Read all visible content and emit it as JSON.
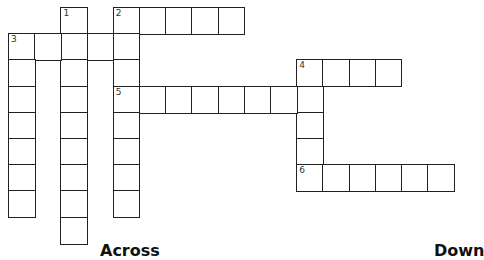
{
  "puzzle": {
    "type": "crossword",
    "grid_origin": {
      "x": 8,
      "y": 7
    },
    "cell_size": 26.2,
    "entries": [
      {
        "number": 1,
        "direction": "down",
        "row": 0,
        "col": 2,
        "length": 9
      },
      {
        "number": 2,
        "direction": "across",
        "row": 0,
        "col": 4,
        "length": 5
      },
      {
        "number": 2,
        "direction": "down",
        "row": 0,
        "col": 4,
        "length": 8
      },
      {
        "number": 3,
        "direction": "across",
        "row": 1,
        "col": 0,
        "length": 5
      },
      {
        "number": 3,
        "direction": "down",
        "row": 1,
        "col": 0,
        "length": 7
      },
      {
        "number": 4,
        "direction": "across",
        "row": 2,
        "col": 11,
        "length": 4
      },
      {
        "number": 4,
        "direction": "down",
        "row": 2,
        "col": 11,
        "length": 5
      },
      {
        "number": 5,
        "direction": "across",
        "row": 3,
        "col": 4,
        "length": 8
      },
      {
        "number": 6,
        "direction": "across",
        "row": 6,
        "col": 11,
        "length": 6
      }
    ]
  },
  "headings": {
    "across": "Across",
    "down": "Down"
  }
}
